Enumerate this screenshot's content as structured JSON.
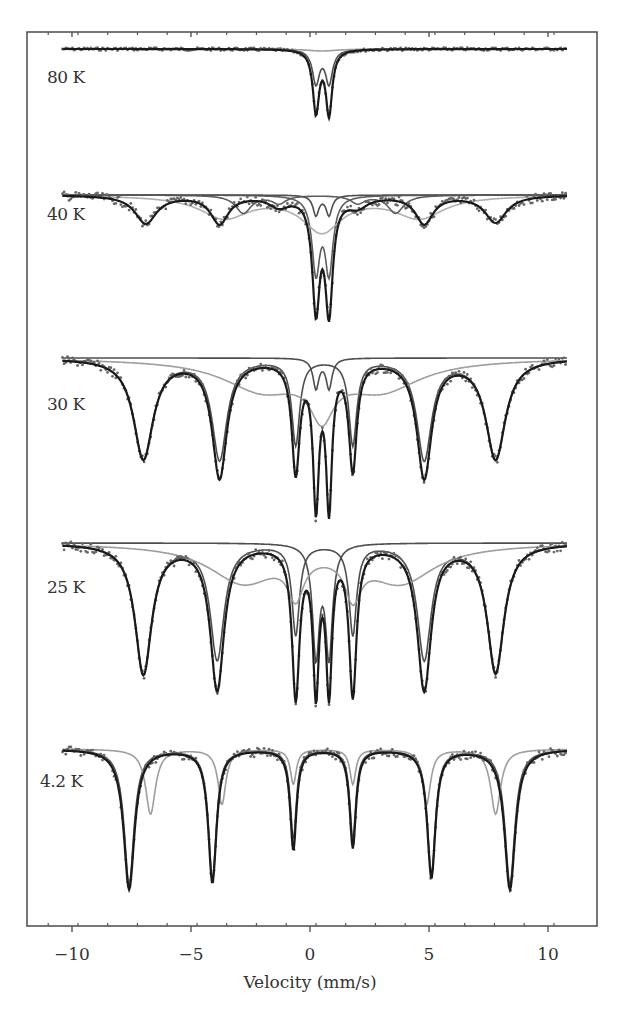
{
  "chart_data": {
    "type": "line",
    "title": "",
    "xlabel": "Velocity (mm/s)",
    "ylabel": "",
    "xlim": [
      -11,
      11
    ],
    "x_ticks": [
      -10,
      -5,
      0,
      5,
      10
    ],
    "x_tick_labels": [
      "−10",
      "−5",
      "0",
      "5",
      "10"
    ],
    "minor_tick_step": 1.2,
    "grid": false,
    "legend": null,
    "panels": [
      {
        "label": "80 K",
        "baseline_y": 49,
        "label_y": 78,
        "total_depth": 64,
        "components": [
          {
            "name": "doublet-inner",
            "color": "#444444",
            "lines": [
              {
                "v": 0.25,
                "d": 34,
                "w": 0.35
              },
              {
                "v": 0.8,
                "d": 34,
                "w": 0.35
              }
            ]
          },
          {
            "name": "broad",
            "color": "#999999",
            "lines": [
              {
                "v": 0.5,
                "d": 2,
                "w": 1.5
              }
            ]
          }
        ],
        "total": [
          {
            "v": 0.25,
            "d": 62,
            "w": 0.32
          },
          {
            "v": 0.8,
            "d": 64,
            "w": 0.32
          }
        ]
      },
      {
        "label": "40 K",
        "baseline_y": 195,
        "label_y": 215,
        "total": [
          {
            "v": -6.9,
            "d": 28,
            "w": 1.1
          },
          {
            "v": -3.8,
            "d": 28,
            "w": 0.9
          },
          {
            "v": -1.3,
            "d": 10,
            "w": 1.0
          },
          {
            "v": 0.25,
            "d": 110,
            "w": 0.38
          },
          {
            "v": 0.8,
            "d": 112,
            "w": 0.38
          },
          {
            "v": 2.0,
            "d": 10,
            "w": 1.0
          },
          {
            "v": 4.8,
            "d": 28,
            "w": 0.9
          },
          {
            "v": 7.8,
            "d": 27,
            "w": 1.1
          }
        ],
        "components": [
          {
            "name": "doublet-inner",
            "color": "#444444",
            "lines": [
              {
                "v": 0.25,
                "d": 20,
                "w": 0.3
              },
              {
                "v": 0.8,
                "d": 20,
                "w": 0.3
              }
            ]
          },
          {
            "name": "doublet-outer",
            "color": "#555555",
            "lines": [
              {
                "v": 0.25,
                "d": 75,
                "w": 0.4
              },
              {
                "v": 0.8,
                "d": 75,
                "w": 0.4
              }
            ]
          },
          {
            "name": "sextet-gray",
            "color": "#aaaaaa",
            "lines": [
              {
                "v": -3.6,
                "d": 22,
                "w": 2.5
              },
              {
                "v": 0.5,
                "d": 35,
                "w": 2.0
              },
              {
                "v": 4.6,
                "d": 22,
                "w": 2.5
              }
            ]
          },
          {
            "name": "sextet-dark",
            "color": "#555555",
            "lines": [
              {
                "v": -2.8,
                "d": 18,
                "w": 0.8
              },
              {
                "v": -1.3,
                "d": 8,
                "w": 0.7
              },
              {
                "v": 2.0,
                "d": 8,
                "w": 0.7
              },
              {
                "v": 3.6,
                "d": 18,
                "w": 0.8
              }
            ]
          }
        ]
      },
      {
        "label": "30 K",
        "baseline_y": 358,
        "label_y": 405,
        "total": [
          {
            "v": -7.0,
            "d": 100,
            "w": 1.0
          },
          {
            "v": -3.8,
            "d": 118,
            "w": 0.75
          },
          {
            "v": -0.6,
            "d": 110,
            "w": 0.4
          },
          {
            "v": 0.25,
            "d": 140,
            "w": 0.3
          },
          {
            "v": 0.8,
            "d": 142,
            "w": 0.3
          },
          {
            "v": 1.8,
            "d": 108,
            "w": 0.4
          },
          {
            "v": 4.8,
            "d": 118,
            "w": 0.75
          },
          {
            "v": 7.8,
            "d": 100,
            "w": 1.0
          }
        ],
        "components": [
          {
            "name": "sextet-main",
            "color": "#444444",
            "lines": [
              {
                "v": -7.0,
                "d": 100,
                "w": 1.0
              },
              {
                "v": -3.8,
                "d": 100,
                "w": 0.75
              },
              {
                "v": -0.6,
                "d": 85,
                "w": 0.4
              },
              {
                "v": 1.8,
                "d": 85,
                "w": 0.4
              },
              {
                "v": 4.8,
                "d": 100,
                "w": 0.75
              },
              {
                "v": 7.8,
                "d": 100,
                "w": 1.0
              }
            ]
          },
          {
            "name": "doublet",
            "color": "#444444",
            "lines": [
              {
                "v": 0.25,
                "d": 30,
                "w": 0.3
              },
              {
                "v": 0.8,
                "d": 30,
                "w": 0.3
              }
            ]
          },
          {
            "name": "broad-gray",
            "color": "#999999",
            "lines": [
              {
                "v": -2.0,
                "d": 30,
                "w": 4.0
              },
              {
                "v": 0.5,
                "d": 45,
                "w": 1.2
              },
              {
                "v": 3.0,
                "d": 30,
                "w": 4.0
              }
            ]
          }
        ]
      },
      {
        "label": "25 K",
        "baseline_y": 543,
        "label_y": 588,
        "total": [
          {
            "v": -7.0,
            "d": 130,
            "w": 0.85
          },
          {
            "v": -3.9,
            "d": 145,
            "w": 0.7
          },
          {
            "v": -0.6,
            "d": 150,
            "w": 0.38
          },
          {
            "v": 0.25,
            "d": 140,
            "w": 0.3
          },
          {
            "v": 0.8,
            "d": 140,
            "w": 0.3
          },
          {
            "v": 1.8,
            "d": 148,
            "w": 0.38
          },
          {
            "v": 4.8,
            "d": 145,
            "w": 0.7
          },
          {
            "v": 7.8,
            "d": 128,
            "w": 0.85
          }
        ],
        "components": [
          {
            "name": "sextet-main",
            "color": "#444444",
            "lines": [
              {
                "v": -7.0,
                "d": 130,
                "w": 0.85
              },
              {
                "v": -3.9,
                "d": 115,
                "w": 0.7
              },
              {
                "v": -0.6,
                "d": 90,
                "w": 0.38
              },
              {
                "v": 1.8,
                "d": 90,
                "w": 0.38
              },
              {
                "v": 4.8,
                "d": 115,
                "w": 0.7
              },
              {
                "v": 7.8,
                "d": 130,
                "w": 0.85
              }
            ]
          },
          {
            "name": "doublet",
            "color": "#444444",
            "lines": [
              {
                "v": 0.25,
                "d": 110,
                "w": 0.35
              },
              {
                "v": 0.8,
                "d": 110,
                "w": 0.35
              }
            ]
          },
          {
            "name": "broad-gray",
            "color": "#999999",
            "lines": [
              {
                "v": -2.8,
                "d": 38,
                "w": 3.5
              },
              {
                "v": -0.6,
                "d": 40,
                "w": 0.8
              },
              {
                "v": 1.8,
                "d": 40,
                "w": 0.8
              },
              {
                "v": 3.8,
                "d": 38,
                "w": 3.5
              }
            ]
          }
        ]
      },
      {
        "label": "4.2 K",
        "baseline_y": 749,
        "label_y": 782,
        "total": [
          {
            "v": -7.6,
            "d": 140,
            "w": 0.55
          },
          {
            "v": -4.1,
            "d": 133,
            "w": 0.42
          },
          {
            "v": -0.7,
            "d": 100,
            "w": 0.32
          },
          {
            "v": 1.8,
            "d": 98,
            "w": 0.32
          },
          {
            "v": 5.1,
            "d": 128,
            "w": 0.42
          },
          {
            "v": 8.4,
            "d": 140,
            "w": 0.55
          }
        ],
        "components": [
          {
            "name": "sextet-A",
            "color": "#444444",
            "lines": [
              {
                "v": -7.6,
                "d": 135,
                "w": 0.5
              },
              {
                "v": -4.1,
                "d": 130,
                "w": 0.4
              },
              {
                "v": -0.7,
                "d": 90,
                "w": 0.3
              },
              {
                "v": 1.8,
                "d": 90,
                "w": 0.3
              },
              {
                "v": 5.1,
                "d": 125,
                "w": 0.4
              },
              {
                "v": 8.4,
                "d": 135,
                "w": 0.5
              }
            ]
          },
          {
            "name": "sextet-B-gray",
            "color": "#999999",
            "lines": [
              {
                "v": -6.7,
                "d": 65,
                "w": 0.5
              },
              {
                "v": -3.7,
                "d": 55,
                "w": 0.4
              },
              {
                "v": -0.7,
                "d": 35,
                "w": 0.3
              },
              {
                "v": 1.8,
                "d": 35,
                "w": 0.3
              },
              {
                "v": 4.9,
                "d": 55,
                "w": 0.4
              },
              {
                "v": 7.8,
                "d": 65,
                "w": 0.5
              }
            ]
          }
        ]
      }
    ],
    "frame": {
      "left": 27,
      "right": 597,
      "top": 32,
      "bottom": 926
    },
    "x_pixel": {
      "v0": 310,
      "px_per_unit": 23.8
    },
    "data_range": [
      -10.4,
      10.8
    ]
  }
}
